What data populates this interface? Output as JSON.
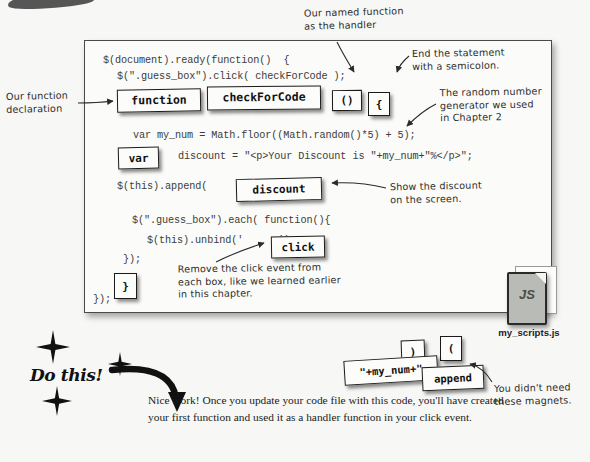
{
  "page": {
    "background_color": "#f7f7f5",
    "ink_color": "#1a1a1a"
  },
  "code_panel": {
    "name": "code-listing",
    "lines": [
      {
        "text": "$(document).ready(function()  {",
        "x": 18,
        "y": 14
      },
      {
        "text": "$(\".guess_box\").click( checkForCode );",
        "x": 32,
        "y": 30
      },
      {
        "text": "var my_num = Math.floor((Math.random()*5) + 5);",
        "x": 48,
        "y": 89
      },
      {
        "text": "discount = \"<p>Your Discount is \"+my_num+\"%</p>\";",
        "x": 93,
        "y": 110
      },
      {
        "text": "$(this).append(",
        "x": 32,
        "y": 140
      },
      {
        "text": ");",
        "x": 218,
        "y": 140
      },
      {
        "text": "$(\".guess_box\").each( function(){",
        "x": 47,
        "y": 174
      },
      {
        "text": "$(this).unbind('",
        "x": 62,
        "y": 194
      },
      {
        "text": "');",
        "x": 193,
        "y": 194
      },
      {
        "text": "});",
        "x": 38,
        "y": 213
      },
      {
        "text": "});",
        "x": 8,
        "y": 253
      }
    ]
  },
  "magnets": [
    {
      "label": "function",
      "name": "magnet-function",
      "x": 117,
      "y": 89,
      "w": 84,
      "h": 23,
      "fs": 11.5,
      "rot": -1.0
    },
    {
      "label": "checkForCode",
      "name": "magnet-checkforcode",
      "x": 207,
      "y": 86,
      "w": 114,
      "h": 24,
      "fs": 11.5,
      "rot": -0.6
    },
    {
      "label": "()",
      "name": "magnet-parens",
      "x": 332,
      "y": 90,
      "w": 30,
      "h": 21,
      "fs": 11,
      "rot": -0.5
    },
    {
      "label": "{",
      "name": "magnet-open-brace",
      "x": 368,
      "y": 92,
      "w": 22,
      "h": 24,
      "fs": 11,
      "rot": 0
    },
    {
      "label": "var",
      "name": "magnet-var",
      "x": 118,
      "y": 147,
      "w": 41,
      "h": 22,
      "fs": 11,
      "rot": -1.5
    },
    {
      "label": "discount",
      "name": "magnet-discount",
      "x": 236,
      "y": 178,
      "w": 86,
      "h": 23,
      "fs": 11,
      "rot": -1.5
    },
    {
      "label": "click",
      "name": "magnet-click",
      "x": 271,
      "y": 236,
      "w": 54,
      "h": 22,
      "fs": 11,
      "rot": -1.0
    },
    {
      "label": "}",
      "name": "magnet-close-brace",
      "x": 114,
      "y": 273,
      "w": 23,
      "h": 26,
      "fs": 11,
      "rot": 0
    }
  ],
  "leftover_magnets": [
    {
      "label": ")",
      "name": "magnet-leftover-close-paren",
      "x": 401,
      "y": 340,
      "w": 24,
      "h": 24,
      "fs": 11,
      "rot": -2
    },
    {
      "label": "(",
      "name": "magnet-leftover-open-paren",
      "x": 440,
      "y": 336,
      "w": 22,
      "h": 25,
      "fs": 11,
      "rot": 0
    },
    {
      "label": "\"+my_num+\"",
      "name": "magnet-leftover-my-num",
      "x": 344,
      "y": 358,
      "w": 94,
      "h": 25,
      "fs": 10.5,
      "rot": -3.5
    },
    {
      "label": "append",
      "name": "magnet-leftover-append",
      "x": 422,
      "y": 366,
      "w": 62,
      "h": 24,
      "fs": 10.5,
      "rot": -2.5
    }
  ],
  "annotations": [
    {
      "name": "annotation-named-function",
      "text": "Our named function\nas the handler",
      "x": 304,
      "y": 6,
      "w": 130,
      "rot": -1.5
    },
    {
      "name": "annotation-end-statement",
      "text": "End the statement\nwith a semicolon.",
      "x": 412,
      "y": 47,
      "w": 125,
      "rot": -1.0
    },
    {
      "name": "annotation-random-number",
      "text": "The random number\ngenerator we used\nin Chapter 2",
      "x": 440,
      "y": 86,
      "w": 130,
      "rot": -1.0
    },
    {
      "name": "annotation-function-declaration",
      "text": "Our function\ndeclaration",
      "x": 6,
      "y": 90,
      "w": 86,
      "rot": -1.2
    },
    {
      "name": "annotation-show-discount",
      "text": "Show the discount\non the screen.",
      "x": 390,
      "y": 180,
      "w": 130,
      "rot": -1.2
    },
    {
      "name": "annotation-remove-click",
      "text": "Remove the click event from\neach box, like we learned earlier\nin this chapter.",
      "x": 178,
      "y": 262,
      "w": 210,
      "rot": -0.8
    },
    {
      "name": "annotation-magnets-unused",
      "text": "You didn't need\nthese magnets.",
      "x": 494,
      "y": 382,
      "w": 96,
      "rot": -1.2
    }
  ],
  "js_file": {
    "name": "js-file-icon",
    "badge": "JS",
    "caption": "my_scripts.js"
  },
  "do_this": {
    "name": "do-this-callout",
    "heading": "Do this!",
    "body": "Nice work! Once you update your code file with this code, you'll have created your first function and used it as a handler function in your click event."
  },
  "stars": [
    {
      "name": "star-top",
      "x": 36,
      "y": 330,
      "size": 34
    },
    {
      "name": "star-middle",
      "x": 108,
      "y": 352,
      "size": 24
    },
    {
      "name": "star-bottom",
      "x": 42,
      "y": 386,
      "size": 30
    }
  ]
}
